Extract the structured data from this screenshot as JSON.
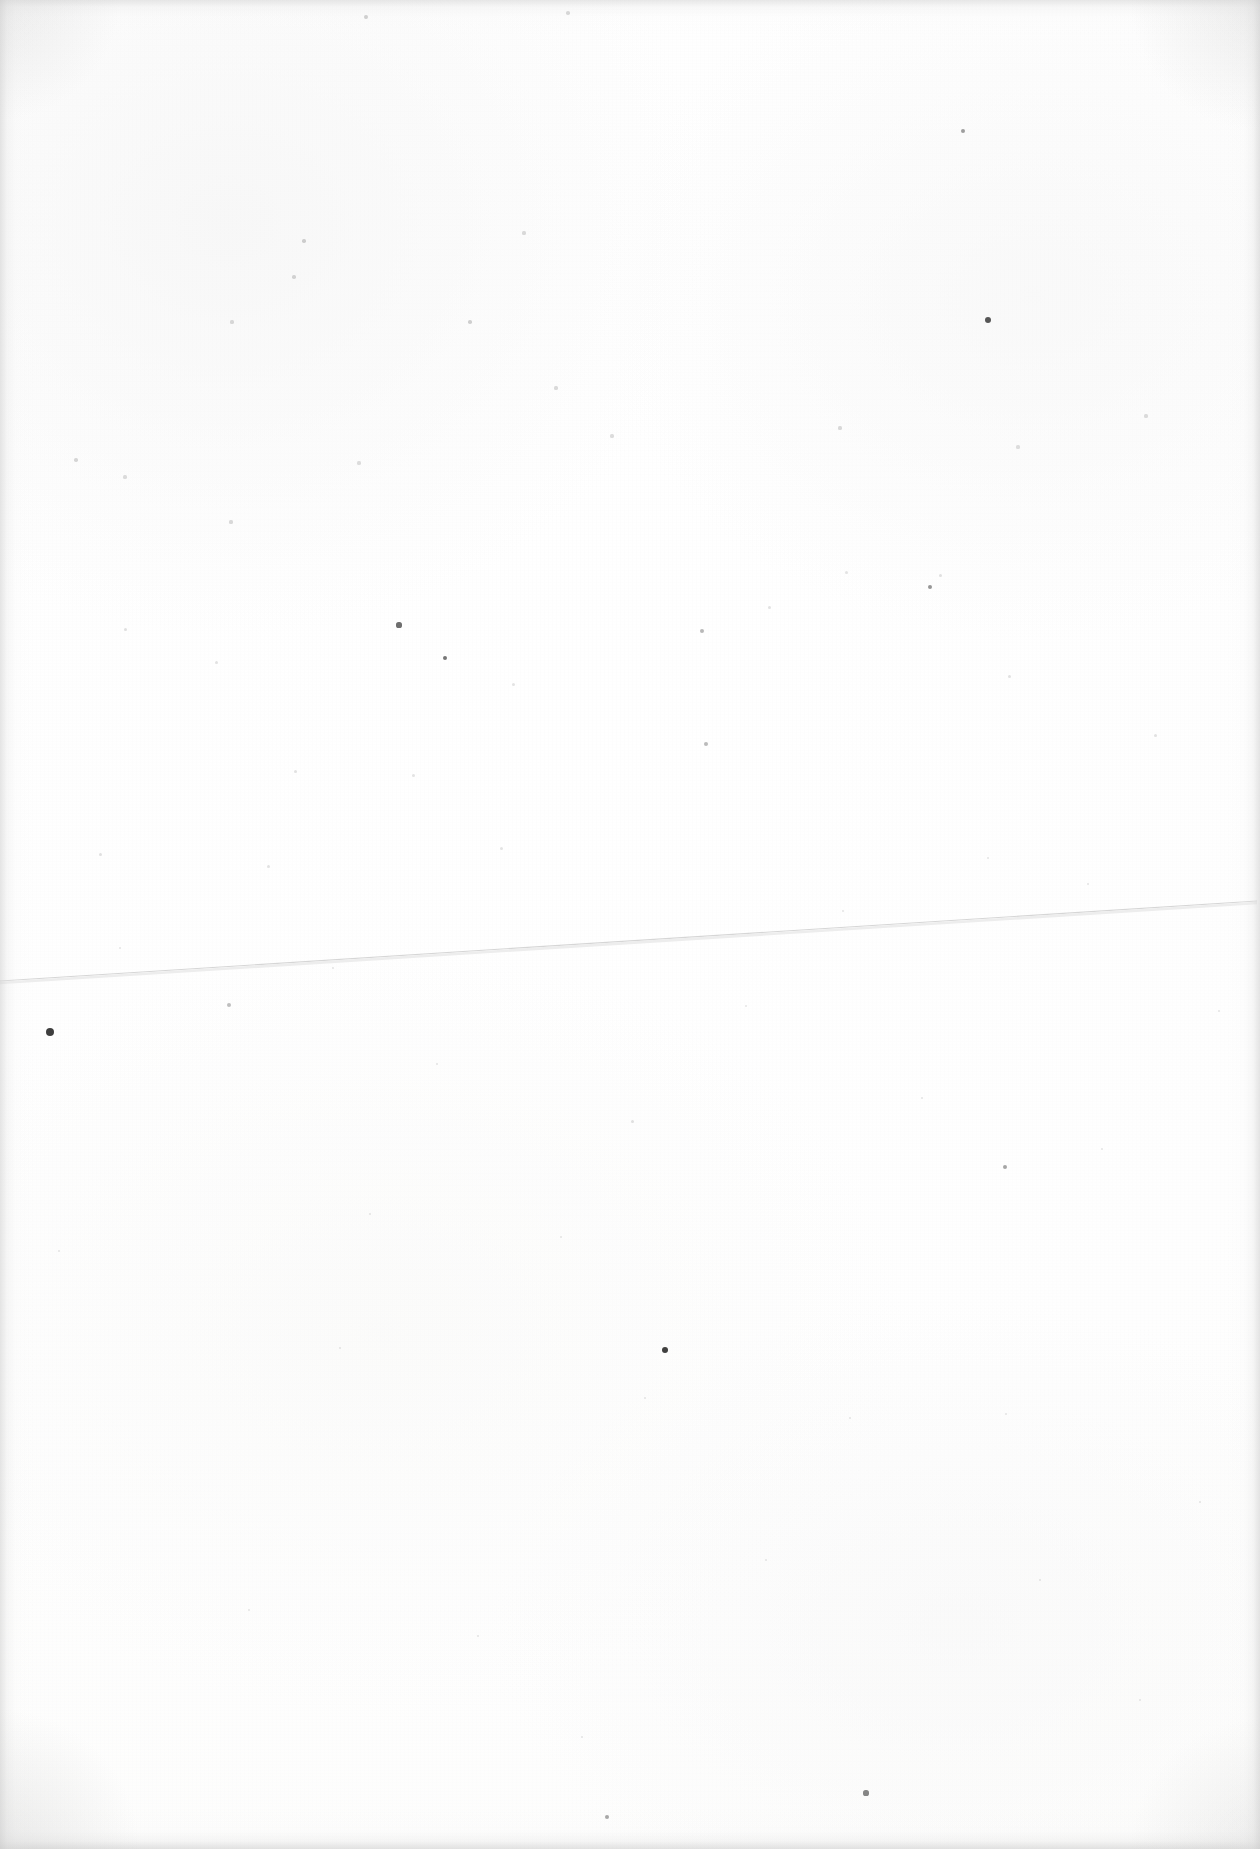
{
  "document": {
    "kind": "scanned-blank-page",
    "page_label": "",
    "visible_text": "",
    "body_text": "",
    "page_number": "",
    "header_text": "",
    "footer_text": "",
    "notes": ""
  },
  "canvas": {
    "width": 1260,
    "height": 1849
  },
  "colors": {
    "paper": "#ffffff",
    "paper_tint": "#fdfdfc",
    "edge_shadow": "#d0d0d0",
    "hairline": "#d8d8d8",
    "speck_dark": "#2b2b2b",
    "speck_mid": "#8f8f8f",
    "speck_light": "#cfcfcf"
  },
  "artifacts": {
    "hairline": {
      "name": "diagonal-crease-line",
      "x1": 0,
      "y1": 981,
      "x2": 1257,
      "y2": 901,
      "stroke": "#d6d6d6",
      "width": 1.1
    },
    "specks": [
      {
        "x": 50,
        "y": 1032,
        "r": 4.2,
        "c": "#2e2e2e",
        "o": 0.92
      },
      {
        "x": 665,
        "y": 1350,
        "r": 3.4,
        "c": "#2a2a2a",
        "o": 0.9
      },
      {
        "x": 988,
        "y": 320,
        "r": 3.0,
        "c": "#3a3a3a",
        "o": 0.85
      },
      {
        "x": 399,
        "y": 625,
        "r": 2.6,
        "c": "#4a4a4a",
        "o": 0.8
      },
      {
        "x": 445,
        "y": 658,
        "r": 2.4,
        "c": "#505050",
        "o": 0.78
      },
      {
        "x": 930,
        "y": 587,
        "r": 2.2,
        "c": "#6a6a6a",
        "o": 0.7
      },
      {
        "x": 963,
        "y": 131,
        "r": 2.2,
        "c": "#6e6e6e",
        "o": 0.66
      },
      {
        "x": 866,
        "y": 1793,
        "r": 2.6,
        "c": "#5c5c5c",
        "o": 0.74
      },
      {
        "x": 607,
        "y": 1817,
        "r": 2.2,
        "c": "#707070",
        "o": 0.64
      },
      {
        "x": 1005,
        "y": 1167,
        "r": 2.3,
        "c": "#707070",
        "o": 0.62
      },
      {
        "x": 702,
        "y": 631,
        "r": 2.0,
        "c": "#848484",
        "o": 0.58
      },
      {
        "x": 706,
        "y": 744,
        "r": 2.0,
        "c": "#868686",
        "o": 0.56
      },
      {
        "x": 229,
        "y": 1005,
        "r": 2.0,
        "c": "#8a8a8a",
        "o": 0.55
      },
      {
        "x": 366,
        "y": 17,
        "r": 1.9,
        "c": "#9a9a9a",
        "o": 0.5
      },
      {
        "x": 568,
        "y": 13,
        "r": 1.8,
        "c": "#a0a0a0",
        "o": 0.46
      },
      {
        "x": 304,
        "y": 241,
        "r": 1.8,
        "c": "#9c9c9c",
        "o": 0.48
      },
      {
        "x": 294,
        "y": 277,
        "r": 1.7,
        "c": "#a2a2a2",
        "o": 0.45
      },
      {
        "x": 470,
        "y": 322,
        "r": 1.8,
        "c": "#9e9e9e",
        "o": 0.48
      },
      {
        "x": 524,
        "y": 233,
        "r": 1.6,
        "c": "#aaaaaa",
        "o": 0.42
      },
      {
        "x": 232,
        "y": 322,
        "r": 1.6,
        "c": "#a8a8a8",
        "o": 0.42
      },
      {
        "x": 76,
        "y": 460,
        "r": 1.7,
        "c": "#a4a4a4",
        "o": 0.44
      },
      {
        "x": 125,
        "y": 477,
        "r": 1.6,
        "c": "#aaaaaa",
        "o": 0.4
      },
      {
        "x": 231,
        "y": 522,
        "r": 1.6,
        "c": "#a6a6a6",
        "o": 0.42
      },
      {
        "x": 359,
        "y": 463,
        "r": 1.6,
        "c": "#acacac",
        "o": 0.4
      },
      {
        "x": 556,
        "y": 388,
        "r": 1.6,
        "c": "#a8a8a8",
        "o": 0.41
      },
      {
        "x": 612,
        "y": 436,
        "r": 1.6,
        "c": "#aaaaaa",
        "o": 0.4
      },
      {
        "x": 840,
        "y": 428,
        "r": 1.6,
        "c": "#a6a6a6",
        "o": 0.42
      },
      {
        "x": 1018,
        "y": 447,
        "r": 1.6,
        "c": "#acacac",
        "o": 0.39
      },
      {
        "x": 1146,
        "y": 416,
        "r": 1.6,
        "c": "#aaaaaa",
        "o": 0.4
      },
      {
        "x": 940,
        "y": 575,
        "r": 1.5,
        "c": "#b0b0b0",
        "o": 0.38
      },
      {
        "x": 769,
        "y": 607,
        "r": 1.5,
        "c": "#b0b0b0",
        "o": 0.37
      },
      {
        "x": 846,
        "y": 572,
        "r": 1.5,
        "c": "#b2b2b2",
        "o": 0.36
      },
      {
        "x": 1009,
        "y": 676,
        "r": 1.5,
        "c": "#b0b0b0",
        "o": 0.37
      },
      {
        "x": 125,
        "y": 629,
        "r": 1.5,
        "c": "#aeaeae",
        "o": 0.38
      },
      {
        "x": 216,
        "y": 662,
        "r": 1.5,
        "c": "#b0b0b0",
        "o": 0.36
      },
      {
        "x": 513,
        "y": 684,
        "r": 1.5,
        "c": "#b2b2b2",
        "o": 0.35
      },
      {
        "x": 295,
        "y": 771,
        "r": 1.5,
        "c": "#b0b0b0",
        "o": 0.36
      },
      {
        "x": 413,
        "y": 775,
        "r": 1.5,
        "c": "#b2b2b2",
        "o": 0.35
      },
      {
        "x": 1155,
        "y": 735,
        "r": 1.5,
        "c": "#b0b0b0",
        "o": 0.36
      },
      {
        "x": 100,
        "y": 854,
        "r": 1.5,
        "c": "#aeaeae",
        "o": 0.37
      },
      {
        "x": 268,
        "y": 866,
        "r": 1.5,
        "c": "#b0b0b0",
        "o": 0.36
      },
      {
        "x": 501,
        "y": 848,
        "r": 1.5,
        "c": "#b2b2b2",
        "o": 0.35
      },
      {
        "x": 843,
        "y": 911,
        "r": 1.4,
        "c": "#b4b4b4",
        "o": 0.34
      },
      {
        "x": 988,
        "y": 858,
        "r": 1.4,
        "c": "#b4b4b4",
        "o": 0.33
      },
      {
        "x": 1088,
        "y": 884,
        "r": 1.4,
        "c": "#b2b2b2",
        "o": 0.34
      },
      {
        "x": 120,
        "y": 948,
        "r": 1.4,
        "c": "#b4b4b4",
        "o": 0.33
      },
      {
        "x": 333,
        "y": 968,
        "r": 1.4,
        "c": "#b2b2b2",
        "o": 0.34
      },
      {
        "x": 632,
        "y": 1121,
        "r": 1.5,
        "c": "#aeaeae",
        "o": 0.37
      },
      {
        "x": 437,
        "y": 1064,
        "r": 1.4,
        "c": "#b2b2b2",
        "o": 0.34
      },
      {
        "x": 746,
        "y": 1006,
        "r": 1.4,
        "c": "#b4b4b4",
        "o": 0.33
      },
      {
        "x": 922,
        "y": 1098,
        "r": 1.4,
        "c": "#b2b2b2",
        "o": 0.34
      },
      {
        "x": 1102,
        "y": 1149,
        "r": 1.4,
        "c": "#b4b4b4",
        "o": 0.33
      },
      {
        "x": 1219,
        "y": 1011,
        "r": 1.4,
        "c": "#b2b2b2",
        "o": 0.34
      },
      {
        "x": 59,
        "y": 1251,
        "r": 1.4,
        "c": "#b4b4b4",
        "o": 0.33
      },
      {
        "x": 370,
        "y": 1214,
        "r": 1.4,
        "c": "#b2b2b2",
        "o": 0.34
      },
      {
        "x": 561,
        "y": 1237,
        "r": 1.4,
        "c": "#b4b4b4",
        "o": 0.33
      },
      {
        "x": 340,
        "y": 1348,
        "r": 1.4,
        "c": "#b2b2b2",
        "o": 0.34
      },
      {
        "x": 645,
        "y": 1398,
        "r": 1.4,
        "c": "#b4b4b4",
        "o": 0.33
      },
      {
        "x": 850,
        "y": 1418,
        "r": 1.4,
        "c": "#b2b2b2",
        "o": 0.34
      },
      {
        "x": 1006,
        "y": 1414,
        "r": 1.4,
        "c": "#b4b4b4",
        "o": 0.33
      },
      {
        "x": 1200,
        "y": 1502,
        "r": 1.4,
        "c": "#b2b2b2",
        "o": 0.34
      },
      {
        "x": 766,
        "y": 1560,
        "r": 1.4,
        "c": "#b4b4b4",
        "o": 0.33
      },
      {
        "x": 1040,
        "y": 1580,
        "r": 1.4,
        "c": "#b2b2b2",
        "o": 0.34
      },
      {
        "x": 249,
        "y": 1610,
        "r": 1.4,
        "c": "#b4b4b4",
        "o": 0.33
      },
      {
        "x": 478,
        "y": 1636,
        "r": 1.4,
        "c": "#b2b2b2",
        "o": 0.34
      },
      {
        "x": 1140,
        "y": 1700,
        "r": 1.4,
        "c": "#b4b4b4",
        "o": 0.33
      },
      {
        "x": 582,
        "y": 1737,
        "r": 1.4,
        "c": "#b2b2b2",
        "o": 0.34
      }
    ]
  }
}
